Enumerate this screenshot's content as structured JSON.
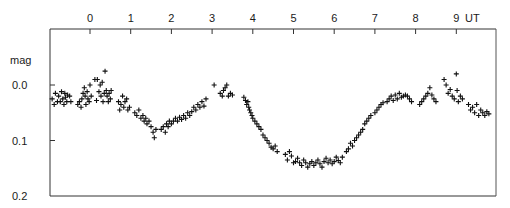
{
  "chart_data": {
    "type": "scatter",
    "title": "",
    "xlabel": "UT",
    "ylabel": "mag",
    "x_ticks": [
      "0",
      "1",
      "2",
      "3",
      "4",
      "5",
      "6",
      "7",
      "8",
      "9"
    ],
    "y_ticks": [
      "0.0",
      "0.1",
      "0.2"
    ],
    "xlim": [
      -0.97,
      9.96
    ],
    "ylim": [
      0.2,
      -0.1
    ],
    "y_inverted": true,
    "grid": false,
    "legend": null,
    "marker": "+",
    "series": [
      {
        "name": "observations",
        "points": [
          [
            -0.93,
            0.025
          ],
          [
            -0.88,
            0.035
          ],
          [
            -0.85,
            0.015
          ],
          [
            -0.8,
            0.03
          ],
          [
            -0.77,
            0.02
          ],
          [
            -0.73,
            0.03
          ],
          [
            -0.7,
            0.012
          ],
          [
            -0.67,
            0.025
          ],
          [
            -0.64,
            0.035
          ],
          [
            -0.62,
            0.015
          ],
          [
            -0.6,
            0.022
          ],
          [
            -0.57,
            0.03
          ],
          [
            -0.55,
            0.018
          ],
          [
            -0.5,
            0.02
          ],
          [
            -0.47,
            0.03
          ],
          [
            -0.3,
            0.035
          ],
          [
            -0.26,
            0.03
          ],
          [
            -0.22,
            0.04
          ],
          [
            -0.2,
            0.025
          ],
          [
            -0.17,
            0.015
          ],
          [
            -0.14,
            0.005
          ],
          [
            -0.12,
            0.02
          ],
          [
            -0.1,
            0.035
          ],
          [
            -0.07,
            0.012
          ],
          [
            -0.05,
            0.025
          ],
          [
            -0.02,
            0.03
          ],
          [
            0.0,
            0.0
          ],
          [
            0.03,
            0.02
          ],
          [
            0.12,
            -0.01
          ],
          [
            0.16,
            0.028
          ],
          [
            0.18,
            -0.01
          ],
          [
            0.22,
            0.012
          ],
          [
            0.25,
            0.0
          ],
          [
            0.27,
            0.02
          ],
          [
            0.3,
            -0.005
          ],
          [
            0.32,
            0.03
          ],
          [
            0.35,
            0.015
          ],
          [
            0.37,
            -0.025
          ],
          [
            0.4,
            0.01
          ],
          [
            0.42,
            0.02
          ],
          [
            0.45,
            0.03
          ],
          [
            0.47,
            0.015
          ],
          [
            0.5,
            0.025
          ],
          [
            0.52,
            0.01
          ],
          [
            0.7,
            0.03
          ],
          [
            0.73,
            0.045
          ],
          [
            0.76,
            0.035
          ],
          [
            0.8,
            0.02
          ],
          [
            0.83,
            0.04
          ],
          [
            0.86,
            0.03
          ],
          [
            0.9,
            0.025
          ],
          [
            0.93,
            0.045
          ],
          [
            0.97,
            0.04
          ],
          [
            1.1,
            0.05
          ],
          [
            1.15,
            0.055
          ],
          [
            1.2,
            0.045
          ],
          [
            1.25,
            0.06
          ],
          [
            1.3,
            0.055
          ],
          [
            1.33,
            0.065
          ],
          [
            1.37,
            0.06
          ],
          [
            1.4,
            0.07
          ],
          [
            1.45,
            0.065
          ],
          [
            1.5,
            0.075
          ],
          [
            1.55,
            0.085
          ],
          [
            1.58,
            0.095
          ],
          [
            1.62,
            0.08
          ],
          [
            1.75,
            0.08
          ],
          [
            1.8,
            0.075
          ],
          [
            1.85,
            0.085
          ],
          [
            1.88,
            0.07
          ],
          [
            1.92,
            0.075
          ],
          [
            1.95,
            0.065
          ],
          [
            2.0,
            0.07
          ],
          [
            2.05,
            0.065
          ],
          [
            2.1,
            0.06
          ],
          [
            2.15,
            0.065
          ],
          [
            2.2,
            0.058
          ],
          [
            2.25,
            0.062
          ],
          [
            2.3,
            0.055
          ],
          [
            2.35,
            0.06
          ],
          [
            2.4,
            0.05
          ],
          [
            2.45,
            0.055
          ],
          [
            2.5,
            0.048
          ],
          [
            2.55,
            0.04
          ],
          [
            2.6,
            0.045
          ],
          [
            2.65,
            0.035
          ],
          [
            2.7,
            0.04
          ],
          [
            2.75,
            0.03
          ],
          [
            2.8,
            0.038
          ],
          [
            2.85,
            0.025
          ],
          [
            3.05,
            0.0
          ],
          [
            3.2,
            0.015
          ],
          [
            3.25,
            0.02
          ],
          [
            3.28,
            0.01
          ],
          [
            3.32,
            0.005
          ],
          [
            3.36,
            0.0
          ],
          [
            3.4,
            0.02
          ],
          [
            3.45,
            0.015
          ],
          [
            3.5,
            0.018
          ],
          [
            3.78,
            0.022
          ],
          [
            3.82,
            0.028
          ],
          [
            3.85,
            0.035
          ],
          [
            3.88,
            0.03
          ],
          [
            3.9,
            0.04
          ],
          [
            3.92,
            0.045
          ],
          [
            3.95,
            0.05
          ],
          [
            3.98,
            0.055
          ],
          [
            4.0,
            0.06
          ],
          [
            4.05,
            0.065
          ],
          [
            4.1,
            0.07
          ],
          [
            4.15,
            0.075
          ],
          [
            4.2,
            0.08
          ],
          [
            4.25,
            0.09
          ],
          [
            4.3,
            0.095
          ],
          [
            4.35,
            0.1
          ],
          [
            4.4,
            0.105
          ],
          [
            4.45,
            0.112
          ],
          [
            4.5,
            0.115
          ],
          [
            4.55,
            0.11
          ],
          [
            4.6,
            0.12
          ],
          [
            4.8,
            0.125
          ],
          [
            4.85,
            0.135
          ],
          [
            4.9,
            0.12
          ],
          [
            4.95,
            0.128
          ],
          [
            5.0,
            0.14
          ],
          [
            5.05,
            0.138
          ],
          [
            5.1,
            0.132
          ],
          [
            5.15,
            0.14
          ],
          [
            5.2,
            0.145
          ],
          [
            5.25,
            0.135
          ],
          [
            5.3,
            0.14
          ],
          [
            5.35,
            0.148
          ],
          [
            5.4,
            0.142
          ],
          [
            5.45,
            0.138
          ],
          [
            5.5,
            0.145
          ],
          [
            5.55,
            0.14
          ],
          [
            5.6,
            0.135
          ],
          [
            5.65,
            0.142
          ],
          [
            5.7,
            0.148
          ],
          [
            5.75,
            0.138
          ],
          [
            5.8,
            0.132
          ],
          [
            5.85,
            0.14
          ],
          [
            5.9,
            0.135
          ],
          [
            5.95,
            0.142
          ],
          [
            6.0,
            0.138
          ],
          [
            6.05,
            0.13
          ],
          [
            6.1,
            0.136
          ],
          [
            6.15,
            0.14
          ],
          [
            6.2,
            0.13
          ],
          [
            6.3,
            0.12
          ],
          [
            6.35,
            0.115
          ],
          [
            6.4,
            0.105
          ],
          [
            6.45,
            0.11
          ],
          [
            6.5,
            0.1
          ],
          [
            6.55,
            0.095
          ],
          [
            6.6,
            0.09
          ],
          [
            6.65,
            0.085
          ],
          [
            6.7,
            0.08
          ],
          [
            6.75,
            0.07
          ],
          [
            6.8,
            0.065
          ],
          [
            6.85,
            0.06
          ],
          [
            6.9,
            0.055
          ],
          [
            7.0,
            0.05
          ],
          [
            7.05,
            0.045
          ],
          [
            7.1,
            0.04
          ],
          [
            7.15,
            0.035
          ],
          [
            7.2,
            0.032
          ],
          [
            7.3,
            0.03
          ],
          [
            7.35,
            0.025
          ],
          [
            7.4,
            0.02
          ],
          [
            7.45,
            0.028
          ],
          [
            7.5,
            0.018
          ],
          [
            7.55,
            0.025
          ],
          [
            7.6,
            0.015
          ],
          [
            7.65,
            0.022
          ],
          [
            7.7,
            0.02
          ],
          [
            7.75,
            0.018
          ],
          [
            7.8,
            0.02
          ],
          [
            7.85,
            0.025
          ],
          [
            7.9,
            0.03
          ],
          [
            8.1,
            0.035
          ],
          [
            8.15,
            0.03
          ],
          [
            8.2,
            0.025
          ],
          [
            8.25,
            0.02
          ],
          [
            8.3,
            0.015
          ],
          [
            8.35,
            0.005
          ],
          [
            8.4,
            0.018
          ],
          [
            8.45,
            0.025
          ],
          [
            8.5,
            0.03
          ],
          [
            8.7,
            -0.01
          ],
          [
            8.75,
            0.0
          ],
          [
            8.8,
            0.015
          ],
          [
            8.85,
            0.008
          ],
          [
            8.9,
            0.02
          ],
          [
            8.95,
            0.025
          ],
          [
            9.0,
            -0.02
          ],
          [
            9.02,
            0.01
          ],
          [
            9.05,
            0.03
          ],
          [
            9.1,
            0.02
          ],
          [
            9.15,
            0.025
          ],
          [
            9.3,
            0.035
          ],
          [
            9.35,
            0.045
          ],
          [
            9.4,
            0.04
          ],
          [
            9.45,
            0.05
          ],
          [
            9.5,
            0.035
          ],
          [
            9.55,
            0.055
          ],
          [
            9.6,
            0.045
          ],
          [
            9.65,
            0.05
          ],
          [
            9.7,
            0.055
          ],
          [
            9.75,
            0.048
          ],
          [
            9.8,
            0.052
          ]
        ]
      }
    ]
  },
  "axes": {
    "x_label": "UT",
    "y_label": "mag",
    "x_ticks": [
      {
        "label": "0",
        "value": 0
      },
      {
        "label": "1",
        "value": 1
      },
      {
        "label": "2",
        "value": 2
      },
      {
        "label": "3",
        "value": 3
      },
      {
        "label": "4",
        "value": 4
      },
      {
        "label": "5",
        "value": 5
      },
      {
        "label": "6",
        "value": 6
      },
      {
        "label": "7",
        "value": 7
      },
      {
        "label": "8",
        "value": 8
      },
      {
        "label": "9",
        "value": 9
      }
    ],
    "y_ticks": [
      {
        "label": "0.0",
        "value": 0.0
      },
      {
        "label": "0.1",
        "value": 0.1
      },
      {
        "label": "0.2",
        "value": 0.2
      }
    ]
  },
  "colors": {
    "ink": "#1a1a1a",
    "frame": "#333333",
    "background": "#ffffff"
  }
}
